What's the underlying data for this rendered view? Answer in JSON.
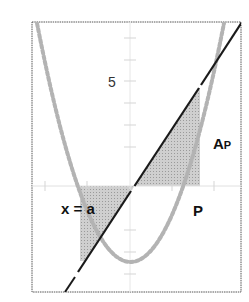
{
  "figure": {
    "type": "diagram",
    "labels": {
      "y_tick": "5",
      "vertical_line": "x = a",
      "area_main": "A",
      "area_sub": "P",
      "curve": "P"
    },
    "colors": {
      "frame": "#555555",
      "curve": "#b0b0b0",
      "line": "#1a1a1a",
      "shade": "#c8c8c8",
      "axis": "#d8d8d8"
    }
  }
}
